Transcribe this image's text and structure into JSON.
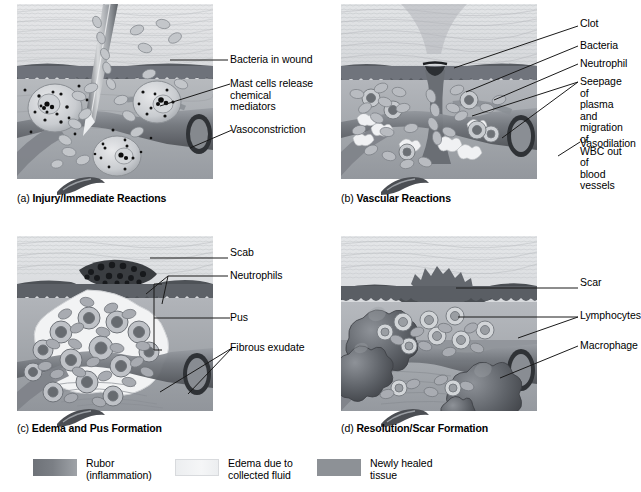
{
  "figure": {
    "background_color": "#ffffff",
    "text_color": "#000000",
    "leader_color": "#1a1a1a"
  },
  "panels": [
    {
      "id": "a",
      "caption_letter": "(a)",
      "caption_text": "Injury/Immediate Reactions",
      "labels": [
        {
          "name": "bacteria-in-wound",
          "text": "Bacteria in wound"
        },
        {
          "name": "mast-cells",
          "text": "Mast cells release\nchemical mediators"
        },
        {
          "name": "vasoconstriction",
          "text": "Vasoconstriction"
        }
      ]
    },
    {
      "id": "b",
      "caption_letter": "(b)",
      "caption_text": "Vascular Reactions",
      "labels": [
        {
          "name": "clot",
          "text": "Clot"
        },
        {
          "name": "bacteria",
          "text": "Bacteria"
        },
        {
          "name": "neutrophil",
          "text": "Neutrophil"
        },
        {
          "name": "seepage",
          "text": "Seepage of\nplasma and\nmigration of\nWBC out of\nblood vessels"
        },
        {
          "name": "vasodilation",
          "text": "Vasodilation"
        }
      ]
    },
    {
      "id": "c",
      "caption_letter": "(c)",
      "caption_text": "Edema and Pus Formation",
      "labels": [
        {
          "name": "scab",
          "text": "Scab"
        },
        {
          "name": "neutrophils",
          "text": "Neutrophils"
        },
        {
          "name": "pus",
          "text": "Pus"
        },
        {
          "name": "fibrous-exudate",
          "text": "Fibrous exudate"
        }
      ]
    },
    {
      "id": "d",
      "caption_letter": "(d)",
      "caption_text": "Resolution/Scar Formation",
      "labels": [
        {
          "name": "scar",
          "text": "Scar"
        },
        {
          "name": "lymphocytes",
          "text": "Lymphocytes"
        },
        {
          "name": "macrophage",
          "text": "Macrophage"
        }
      ]
    }
  ],
  "legend": {
    "items": [
      {
        "name": "rubor",
        "text": "Rubor\n(inflammation)",
        "color": "#6e7278",
        "color2": "#9fa3a8"
      },
      {
        "name": "edema",
        "text": "Edema due to\ncollected fluid",
        "color": "#eceef0",
        "color2": "#f4f5f6"
      },
      {
        "name": "newly-healed-tissue",
        "text": "Newly healed\ntissue",
        "color": "#8d9196",
        "color2": "#8d9196"
      }
    ]
  }
}
